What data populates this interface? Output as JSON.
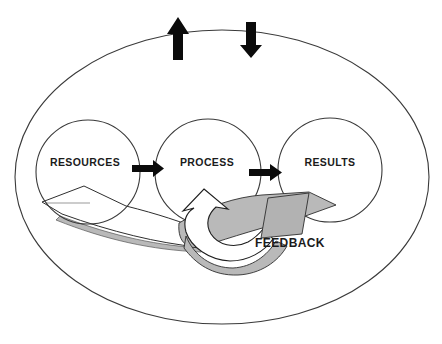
{
  "diagram": {
    "nodes": [
      {
        "label": "RESOURCES"
      },
      {
        "label": "PROCESS"
      },
      {
        "label": "RESULTS"
      }
    ],
    "feedback_label": "FEEDBACK",
    "colors": {
      "background": "#ffffff",
      "outline": "#3a3a3a",
      "ribbon_outline": "#2e2e2e",
      "black_arrow": "#0b0b0b",
      "ribbon_gray": "#b9b9b9",
      "ribbon_fold_gray": "#b2b2b2",
      "white_fill": "#ffffff",
      "text": "#1b1b1b"
    }
  }
}
